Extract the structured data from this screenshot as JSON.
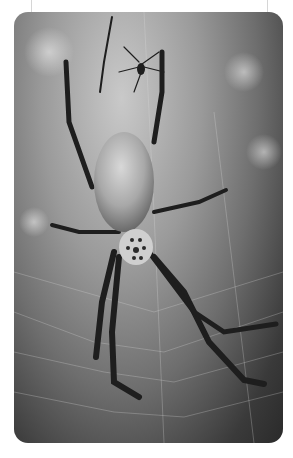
{
  "image": {
    "description": "Black and white photograph of a golden orb-weaver spider in its web, with a smaller male spider above",
    "subject": "spider",
    "style": "grayscale",
    "corner_radius": 14,
    "colors": {
      "background": "#ffffff",
      "guide_line": "#d6d6d6",
      "body_light": "#cfcfcf",
      "legs": "#1e1e1e"
    }
  }
}
